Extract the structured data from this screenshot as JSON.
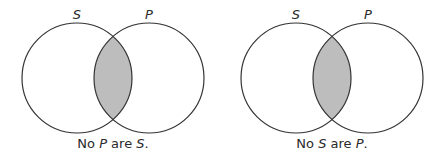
{
  "diagrams": [
    {
      "left_label": "S",
      "right_label": "P",
      "caption_parts": [
        "No ",
        "P",
        " are ",
        "S",
        "."
      ],
      "caption": "No P are S.",
      "shaded_region": "intersection"
    },
    {
      "left_label": "S",
      "right_label": "P",
      "caption_parts": [
        "No ",
        "S",
        " are ",
        "P",
        "."
      ],
      "caption": "No S are P.",
      "shaded_region": "intersection"
    }
  ],
  "colors": {
    "stroke": "#333333",
    "shade": "#bdbdbd",
    "background": "#ffffff"
  }
}
